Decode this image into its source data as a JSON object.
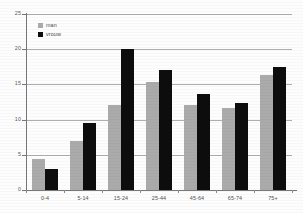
{
  "chart_data": {
    "type": "bar",
    "title": "",
    "subtitle": "",
    "xlabel": "",
    "ylabel": "",
    "categories": [
      "0-4",
      "5-14",
      "15-24",
      "25-44",
      "45-64",
      "65-74",
      "75+"
    ],
    "series": [
      {
        "name": "man",
        "color": "#ababab",
        "values": [
          4.4,
          7.0,
          12.1,
          15.3,
          12.1,
          11.6,
          16.4
        ]
      },
      {
        "name": "vrouw",
        "color": "#0d0d0d",
        "values": [
          3.0,
          9.5,
          20.1,
          17.1,
          13.7,
          12.4,
          17.5
        ]
      }
    ],
    "ylim": [
      0,
      25
    ],
    "yticks": [
      0,
      5,
      10,
      15,
      20,
      25
    ],
    "ytick_labels": [
      "0",
      "5",
      "10",
      "15",
      "20",
      "25"
    ],
    "grid": true,
    "grid_axis": "y",
    "legend_position": "top-left-inside"
  },
  "legend": {
    "items": [
      {
        "label": "man",
        "color": "#ababab"
      },
      {
        "label": "vrouw",
        "color": "#0d0d0d"
      }
    ]
  },
  "colors": {
    "series_man": "#ababab",
    "series_vrouw": "#0d0d0d",
    "gridline": "#aeaeae",
    "axis": "#777777",
    "tick_text": "#5a5a5a",
    "background": "#fdfdfd"
  }
}
